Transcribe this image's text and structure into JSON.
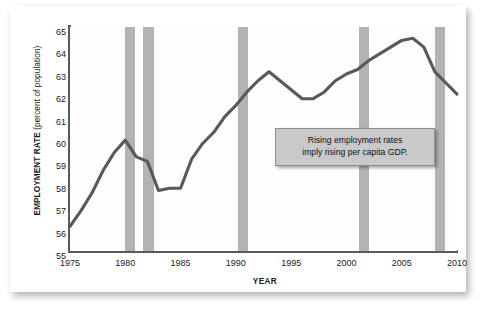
{
  "chart_data": {
    "type": "line",
    "title": "",
    "xlabel": "YEAR",
    "ylabel": "EMPLOYMENT RATE (percent of population)",
    "ylabel_main": "EMPLOYMENT RATE",
    "ylabel_unit": "(percent of population)",
    "xlim": [
      1975,
      2010
    ],
    "ylim": [
      55,
      65
    ],
    "grid": false,
    "legend": "none",
    "xticks": [
      1975,
      1980,
      1985,
      1990,
      1995,
      2000,
      2005,
      2010
    ],
    "xtick_labels": [
      "1975",
      "1980",
      "1985",
      "1990",
      "1995",
      "2000",
      "2005",
      "2010"
    ],
    "yticks": [
      55,
      56,
      57,
      58,
      59,
      60,
      61,
      62,
      63,
      64,
      65
    ],
    "ytick_labels": [
      "55",
      "56",
      "57",
      "58",
      "59",
      "60",
      "61",
      "62",
      "63",
      "64",
      "65"
    ],
    "line_color": "#595959",
    "band_color": "#b3b3b3",
    "series": [
      {
        "name": "Employment rate",
        "x": [
          1975,
          1976,
          1977,
          1978,
          1979,
          1980,
          1981,
          1982,
          1983,
          1984,
          1985,
          1986,
          1987,
          1988,
          1989,
          1990,
          1991,
          1992,
          1993,
          1994,
          1995,
          1996,
          1997,
          1998,
          1999,
          2000,
          2001,
          2002,
          2003,
          2004,
          2005,
          2006,
          2007,
          2008,
          2009,
          2010
        ],
        "values": [
          56.1,
          56.8,
          57.6,
          58.6,
          59.4,
          59.95,
          59.2,
          59.0,
          57.7,
          57.8,
          57.8,
          59.1,
          59.8,
          60.3,
          61.0,
          61.5,
          62.1,
          62.6,
          63.0,
          62.6,
          62.2,
          61.8,
          61.8,
          62.1,
          62.6,
          62.9,
          63.1,
          63.5,
          63.8,
          64.1,
          64.4,
          64.5,
          64.1,
          63.0,
          62.5,
          62.0
        ]
      }
    ],
    "annotations": [
      {
        "name": "recession-band",
        "label": "recession band",
        "start": 1980.0,
        "end": 1980.85
      },
      {
        "name": "recession-band",
        "label": "recession band",
        "start": 1981.6,
        "end": 1982.6
      },
      {
        "name": "recession-band",
        "label": "recession band",
        "start": 1990.2,
        "end": 1991.1
      },
      {
        "name": "recession-band",
        "label": "recession band",
        "start": 2001.1,
        "end": 2002.0
      },
      {
        "name": "recession-band",
        "label": "recession band",
        "start": 2008.0,
        "end": 2008.9
      }
    ],
    "callout": {
      "line1": "Rising employment rates",
      "line2": "imply rising per capita GDP."
    }
  }
}
